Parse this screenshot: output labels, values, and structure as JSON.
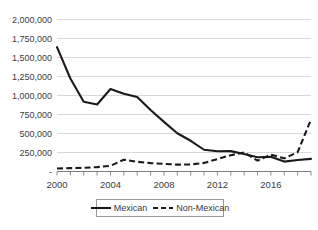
{
  "chart_data": {
    "type": "line",
    "title": "",
    "subtitle": "",
    "xlabel": "",
    "ylabel": "",
    "x": [
      2000,
      2001,
      2002,
      2003,
      2004,
      2005,
      2006,
      2007,
      2008,
      2009,
      2010,
      2011,
      2012,
      2013,
      2014,
      2015,
      2016,
      2017,
      2018,
      2019
    ],
    "xlim": [
      2000,
      2019
    ],
    "ylim": [
      0,
      2000000
    ],
    "grid": true,
    "legend_position": "bottom",
    "series": [
      {
        "name": "Mexican",
        "style": "solid",
        "color": "#1a1a1a",
        "values": [
          1636883,
          1224000,
          917993,
          882012,
          1085006,
          1023905,
          981066,
          808688,
          653035,
          503386,
          404365,
          286154,
          265755,
          267734,
          229178,
          188122,
          192969,
          130454,
          152257,
          166458
        ]
      },
      {
        "name": "Non-Mexican",
        "style": "dashed",
        "color": "#1a1a1a",
        "values": [
          39000,
          44000,
          48000,
          58000,
          75000,
          155000,
          128000,
          110000,
          101000,
          90000,
          93000,
          113000,
          164000,
          215000,
          250000,
          143000,
          222000,
          173000,
          254000,
          685000
        ]
      }
    ],
    "y_ticks": [
      {
        "value": 2000000,
        "label": "2,000,000"
      },
      {
        "value": 1750000,
        "label": "1,750,000"
      },
      {
        "value": 1500000,
        "label": "1,500,000"
      },
      {
        "value": 1250000,
        "label": "1,250,000"
      },
      {
        "value": 1000000,
        "label": "1,000,000"
      },
      {
        "value": 750000,
        "label": "750,000"
      },
      {
        "value": 500000,
        "label": "500,000"
      },
      {
        "value": 250000,
        "label": "250,000"
      },
      {
        "value": 0,
        "label": "-"
      }
    ],
    "x_ticks": [
      {
        "value": 2000,
        "label": "2000"
      },
      {
        "value": 2004,
        "label": "2004"
      },
      {
        "value": 2008,
        "label": "2008"
      },
      {
        "value": 2012,
        "label": "2012"
      },
      {
        "value": 2016,
        "label": "2016"
      }
    ]
  },
  "legend": {
    "items": [
      {
        "label": "Mexican",
        "style": "solid"
      },
      {
        "label": "Non-Mexican",
        "style": "dashed"
      }
    ]
  }
}
